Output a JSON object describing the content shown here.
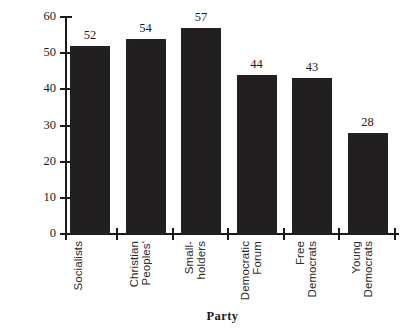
{
  "chart_data": {
    "type": "bar",
    "title": "",
    "xlabel": "Party",
    "ylabel": "Average Age",
    "categories": [
      "Socialists",
      "Christian Peoples'",
      "Small-holders",
      "Democratic Forum",
      "Free Democrats",
      "Young Democrats"
    ],
    "category_lines": [
      [
        "Socialists"
      ],
      [
        "Christian",
        "Peoples'"
      ],
      [
        "Small-",
        "holders"
      ],
      [
        "Democratic",
        "Forum"
      ],
      [
        "Free",
        "Democrats"
      ],
      [
        "Young",
        "Democrats"
      ]
    ],
    "values": [
      52,
      54,
      57,
      44,
      43,
      28
    ],
    "value_labels": [
      "52",
      "54",
      "57",
      "44",
      "43",
      "28"
    ],
    "ylim": [
      0,
      60
    ],
    "yticks": [
      0,
      10,
      20,
      30,
      40,
      50,
      60
    ],
    "ytick_labels": [
      "0",
      "10",
      "20",
      "30",
      "40",
      "50",
      "60"
    ],
    "grid": false,
    "legend": false,
    "bar_color": "#201e1e",
    "axis_color": "#1a1a1a",
    "background_color": "#ffffff"
  }
}
